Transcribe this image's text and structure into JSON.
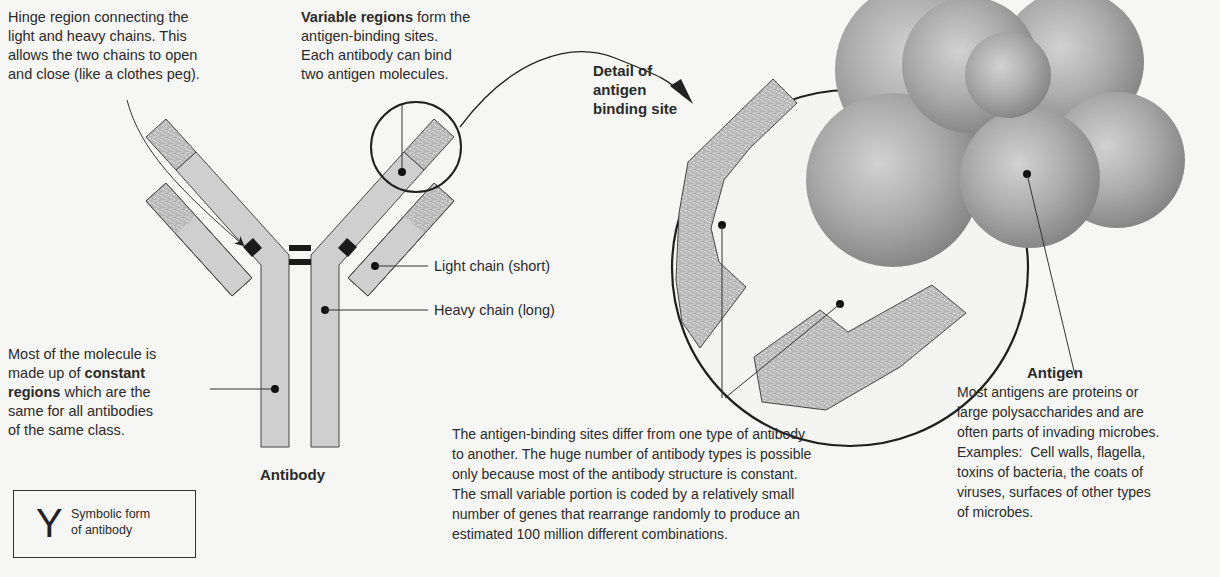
{
  "hinge_note": {
    "lines": [
      "Hinge region connecting the",
      "light and heavy chains. This",
      "allows the two chains to open",
      "and close (like a clothes peg)."
    ]
  },
  "variable_note": {
    "bold": "Variable regions",
    "line1_rest": " form the",
    "lines": [
      "antigen-binding sites.",
      "Each antibody can bind",
      "two antigen molecules."
    ]
  },
  "detail_title": {
    "lines": [
      "Detail of",
      "antigen",
      "binding site"
    ]
  },
  "light_chain_label": "Light chain (short)",
  "heavy_chain_label": "Heavy chain (long)",
  "constant_note": {
    "line1": "Most of the molecule is",
    "line2_pre": "made up of ",
    "line2_bold": "constant",
    "line3_bold": "regions",
    "line3_rest": " which are the",
    "line4": "same for all antibodies",
    "line5": "of the same class."
  },
  "antibody_caption": "Antibody",
  "symbolic": {
    "glyph": "Y",
    "lines": [
      "Symbolic form",
      "of antibody"
    ]
  },
  "binding_note": {
    "lines": [
      "The antigen-binding sites differ from one type of antibody",
      "to another. The huge number of antibody types is possible",
      "only because most of the antibody structure is constant.",
      "The small variable portion is coded by a relatively small",
      "number of genes that rearrange randomly to produce an",
      "estimated 100 million different combinations."
    ]
  },
  "antigen": {
    "title": "Antigen",
    "lines": [
      "Most antigens are proteins or",
      "large polysaccharides and are",
      "often parts of invading microbes.",
      "Examples:  Cell walls, flagella,",
      "toxins of bacteria, the coats of",
      "viruses, surfaces of other types",
      "of microbes."
    ]
  },
  "colors": {
    "chain_fill": "#cfcfcf",
    "variable_fill": "#bdbdbd",
    "outline": "#333333",
    "sphere_mid": "#a9a9a9",
    "background": "#f6f6f4"
  }
}
